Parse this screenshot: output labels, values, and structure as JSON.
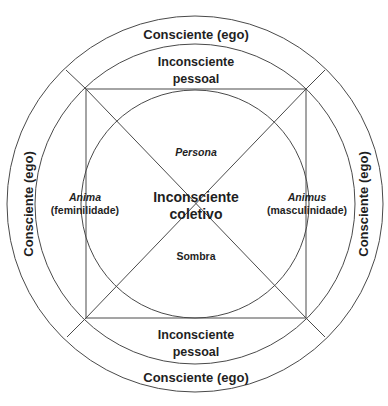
{
  "diagram": {
    "rings": {
      "outer": {
        "label_top": "Consciente (ego)",
        "label_bottom": "Consciente (ego)",
        "label_left": "Consciente (ego)",
        "label_right": "Consciente (ego)"
      },
      "middle": {
        "label_top_line1": "Inconsciente",
        "label_top_line2": "pessoal",
        "label_bottom_line1": "Inconsciente",
        "label_bottom_line2": "pessoal"
      }
    },
    "core": {
      "line1": "Inconsciente",
      "line2": "coletivo"
    },
    "archetypes": {
      "top": "Persona",
      "bottom": "Sombra",
      "left_name": "Anima",
      "left_desc": "(feminilidade)",
      "right_name": "Animus",
      "right_desc": "(masculinidade)"
    },
    "colors": {
      "line": "#4a4a4a",
      "text": "#1f1f1f",
      "background": "#ffffff"
    }
  }
}
